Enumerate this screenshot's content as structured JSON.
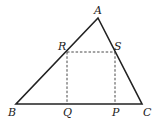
{
  "diagram": {
    "title": "",
    "type": "triangle-with-inscribed-rectangle",
    "colors": {
      "stroke": "#222222",
      "dashed": "#333333",
      "background": "#ffffff"
    },
    "points": {
      "A": {
        "label": "A",
        "x": 98,
        "y": 18
      },
      "B": {
        "label": "B",
        "x": 16,
        "y": 104
      },
      "C": {
        "label": "C",
        "x": 142,
        "y": 104
      },
      "R": {
        "label": "R",
        "x": 67,
        "y": 52
      },
      "S": {
        "label": "S",
        "x": 115,
        "y": 52
      },
      "Q": {
        "label": "Q",
        "x": 67,
        "y": 104
      },
      "P": {
        "label": "P",
        "x": 115,
        "y": 104
      }
    },
    "solid_segments": [
      "AB",
      "BC",
      "CA"
    ],
    "dashed_segments": [
      "RS",
      "RQ",
      "SP"
    ]
  }
}
